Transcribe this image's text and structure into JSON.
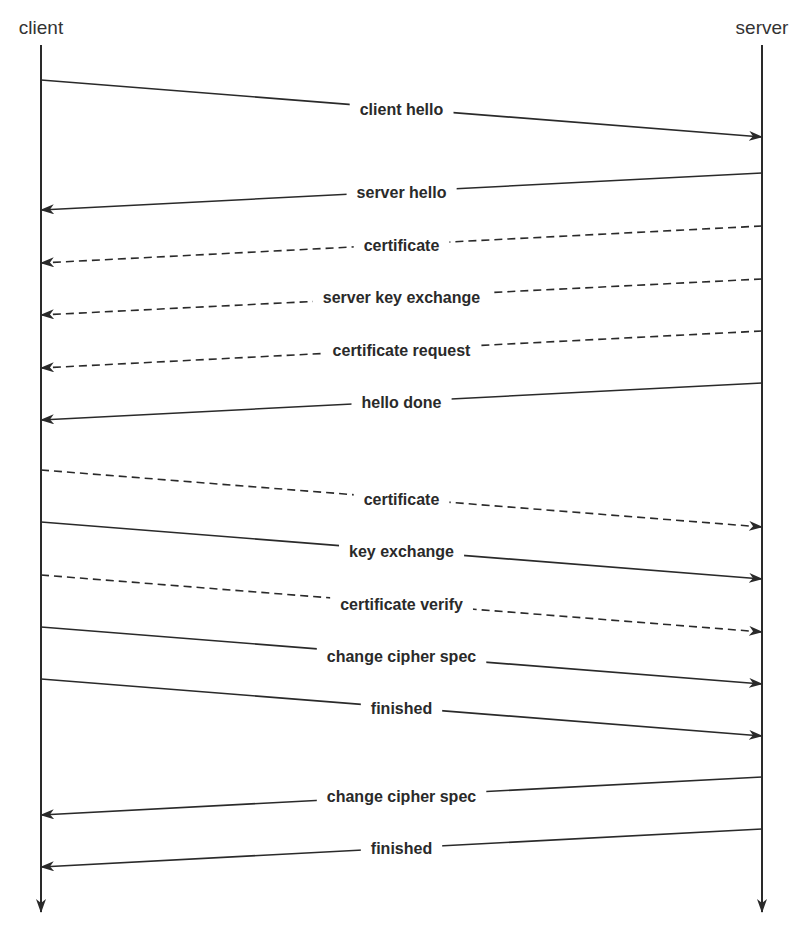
{
  "diagram": {
    "type": "sequence",
    "lifelines": {
      "client": {
        "label": "client",
        "x": 41
      },
      "server": {
        "label": "server",
        "x": 762
      }
    },
    "line_color": "#2a2a2a",
    "messages": [
      {
        "label": "client hello",
        "from": "client",
        "to": "server",
        "style": "solid",
        "y_start": 80,
        "y_end": 137
      },
      {
        "label": "server hello",
        "from": "server",
        "to": "client",
        "style": "solid",
        "y_start": 173,
        "y_end": 210
      },
      {
        "label": "certificate",
        "from": "server",
        "to": "client",
        "style": "dashed",
        "y_start": 226,
        "y_end": 263
      },
      {
        "label": "server key exchange",
        "from": "server",
        "to": "client",
        "style": "dashed",
        "y_start": 279,
        "y_end": 315
      },
      {
        "label": "certificate request",
        "from": "server",
        "to": "client",
        "style": "dashed",
        "y_start": 331,
        "y_end": 368
      },
      {
        "label": "hello done",
        "from": "server",
        "to": "client",
        "style": "solid",
        "y_start": 383,
        "y_end": 420
      },
      {
        "label": "certificate",
        "from": "client",
        "to": "server",
        "style": "dashed",
        "y_start": 470,
        "y_end": 527
      },
      {
        "label": "key exchange",
        "from": "client",
        "to": "server",
        "style": "solid",
        "y_start": 522,
        "y_end": 579
      },
      {
        "label": "certificate verify",
        "from": "client",
        "to": "server",
        "style": "dashed",
        "y_start": 575,
        "y_end": 632
      },
      {
        "label": "change cipher spec",
        "from": "client",
        "to": "server",
        "style": "solid",
        "y_start": 627,
        "y_end": 684
      },
      {
        "label": "finished",
        "from": "client",
        "to": "server",
        "style": "solid",
        "y_start": 679,
        "y_end": 736
      },
      {
        "label": "change cipher spec",
        "from": "server",
        "to": "client",
        "style": "solid",
        "y_start": 777,
        "y_end": 815
      },
      {
        "label": "finished",
        "from": "server",
        "to": "client",
        "style": "solid",
        "y_start": 829,
        "y_end": 867
      }
    ]
  }
}
